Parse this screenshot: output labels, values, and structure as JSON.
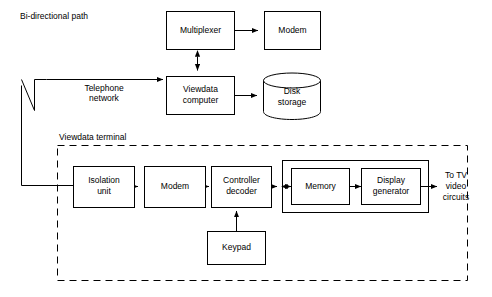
{
  "diagram": {
    "colors": {
      "background": "#ffffff",
      "stroke": "#000000",
      "text": "#000000"
    },
    "annotations": {
      "bidirectional_path": "Bi-directional path",
      "telephone_network": "Telephone\nnetwork",
      "telephone_network_line1": "Telephone",
      "telephone_network_line2": "network",
      "viewdata_terminal": "Viewdata terminal",
      "to_tv_line1": "To TV",
      "to_tv_line2": "video",
      "to_tv_line3": "circuits"
    },
    "nodes": {
      "multiplexer": {
        "label": "Multiplexer",
        "shape": "rect"
      },
      "modem_top": {
        "label": "Modem",
        "shape": "rect"
      },
      "viewdata_computer_line1": "Viewdata",
      "viewdata_computer_line2": "computer",
      "disk_storage_line1": "Disk",
      "disk_storage_line2": "storage",
      "isolation_unit_line1": "Isolation",
      "isolation_unit_line2": "unit",
      "modem_terminal": {
        "label": "Modem",
        "shape": "rect"
      },
      "controller_decoder_line1": "Controller",
      "controller_decoder_line2": "decoder",
      "memory": {
        "label": "Memory",
        "shape": "rect"
      },
      "display_generator_line1": "Display",
      "display_generator_line2": "generator",
      "keypad": {
        "label": "Keypad",
        "shape": "rect"
      }
    }
  }
}
